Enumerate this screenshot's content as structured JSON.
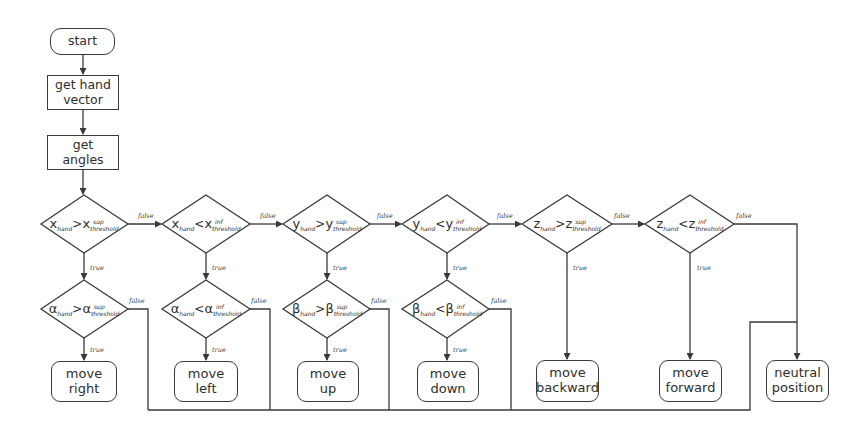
{
  "diagram": {
    "type": "flowchart",
    "start": {
      "label": "start"
    },
    "process": [
      {
        "id": "get-hand-vector",
        "lines": [
          "get hand",
          "vector"
        ]
      },
      {
        "id": "get-angles",
        "lines": [
          "get",
          "angles"
        ]
      }
    ],
    "edge_labels": {
      "true": "true",
      "false": "false"
    },
    "axis_checks": [
      {
        "id": "x-sup",
        "var": "x",
        "sub": "hand",
        "op": ">",
        "sup": "sup",
        "thr": "threshold"
      },
      {
        "id": "x-inf",
        "var": "x",
        "sub": "hand",
        "op": "<",
        "sup": "inf",
        "thr": "threshold"
      },
      {
        "id": "y-sup",
        "var": "y",
        "sub": "hand",
        "op": ">",
        "sup": "sup",
        "thr": "threshold"
      },
      {
        "id": "y-inf",
        "var": "y",
        "sub": "hand",
        "op": "<",
        "sup": "inf",
        "thr": "threshold"
      },
      {
        "id": "z-sup",
        "var": "z",
        "sub": "hand",
        "op": ">",
        "sup": "sup",
        "thr": "threshold"
      },
      {
        "id": "z-inf",
        "var": "z",
        "sub": "hand",
        "op": "<",
        "sup": "inf",
        "thr": "threshold"
      }
    ],
    "angle_checks": [
      {
        "id": "alpha-sup",
        "var": "α",
        "sub": "hand",
        "op": ">",
        "sup": "sup",
        "thr": "threshold"
      },
      {
        "id": "alpha-inf",
        "var": "α",
        "sub": "hand",
        "op": "<",
        "sup": "inf",
        "thr": "threshold"
      },
      {
        "id": "beta-sup",
        "var": "β",
        "sub": "hand",
        "op": ">",
        "sup": "sup",
        "thr": "threshold"
      },
      {
        "id": "beta-inf",
        "var": "β",
        "sub": "hand",
        "op": "<",
        "sup": "inf",
        "thr": "threshold"
      }
    ],
    "actions": [
      {
        "id": "move-right",
        "lines": [
          "move",
          "right"
        ]
      },
      {
        "id": "move-left",
        "lines": [
          "move",
          "left"
        ]
      },
      {
        "id": "move-up",
        "lines": [
          "move",
          "up"
        ]
      },
      {
        "id": "move-down",
        "lines": [
          "move",
          "down"
        ]
      },
      {
        "id": "move-backward",
        "lines": [
          "move",
          "backward"
        ]
      },
      {
        "id": "move-forward",
        "lines": [
          "move",
          "forward"
        ]
      },
      {
        "id": "neutral-position",
        "lines": [
          "neutral",
          "position"
        ]
      }
    ]
  }
}
